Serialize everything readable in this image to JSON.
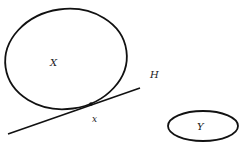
{
  "diagram": {
    "set_x": {
      "label": "X",
      "description": "large closed region"
    },
    "line_h": {
      "label": "H",
      "description": "line tangent to X"
    },
    "point_x": {
      "label": "x",
      "description": "point of contact between H and X"
    },
    "set_y": {
      "label": "Y",
      "description": "small ellipse separated from X"
    }
  },
  "colors": {
    "stroke": "#111111",
    "background": "#ffffff"
  }
}
